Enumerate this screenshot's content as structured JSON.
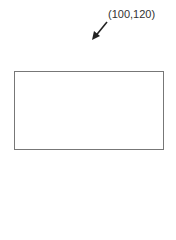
{
  "annotation": {
    "label": "(100,120)",
    "arrow": {
      "from": [
        107,
        22
      ],
      "to": [
        93,
        39
      ],
      "color": "#222222"
    }
  },
  "rectangle": {
    "x": 14,
    "y": 71,
    "width": 148,
    "height": 77,
    "stroke": "#777777",
    "fill": "#ffffff"
  }
}
